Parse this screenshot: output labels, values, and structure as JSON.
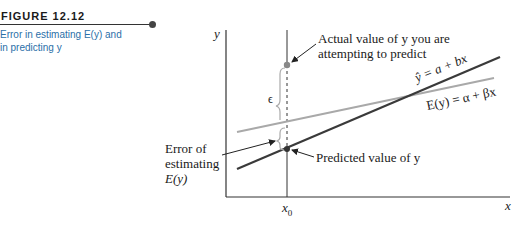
{
  "caption": {
    "figure_label": "FIGURE 12.12",
    "text_line1": "Error in estimating E(y) and",
    "text_line2": "in predicting y"
  },
  "axes": {
    "y_label": "y",
    "x_label": "x",
    "x0_label": "x",
    "x0_subscript": "0"
  },
  "annotations": {
    "actual_line1": "Actual value of y you are",
    "actual_line2": "attempting to predict",
    "predicted": "Predicted value of y",
    "error_line1": "Error of",
    "error_line2": "estimating",
    "error_line3": "E(y)",
    "epsilon": "ϵ"
  },
  "lines": {
    "fitted_label": "ŷ = a + bx",
    "true_label": "E(y) = α + βx"
  },
  "colors": {
    "axis": "#333333",
    "fitted_line": "#3a3a3a",
    "true_line": "#a9a9a9",
    "caption_text": "#2a6fa8",
    "point": "#888888"
  }
}
